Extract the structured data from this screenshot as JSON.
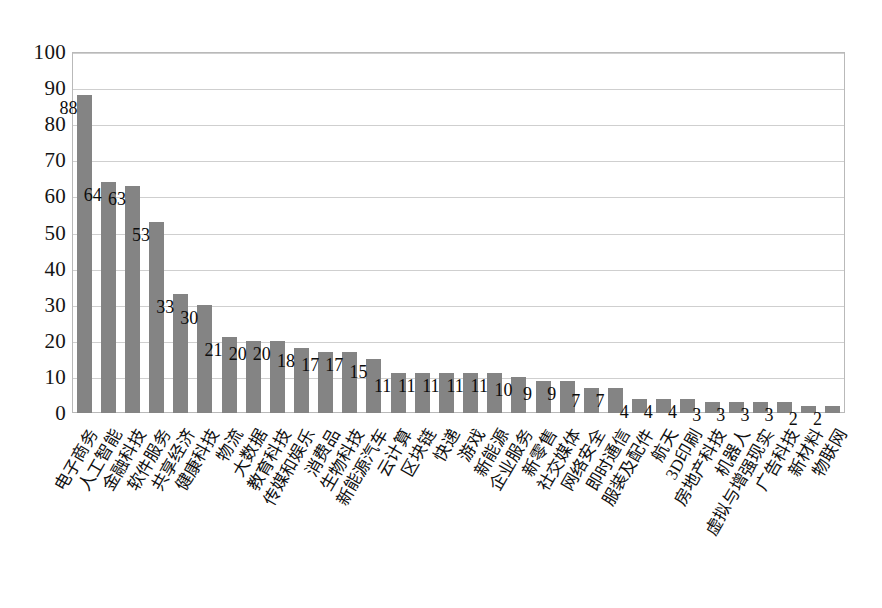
{
  "chart_data": {
    "type": "bar",
    "title": "",
    "subtitle": "",
    "xlabel": "",
    "ylabel": "",
    "ylim": [
      0,
      100
    ],
    "yticks": [
      0,
      10,
      20,
      30,
      40,
      50,
      60,
      70,
      80,
      90,
      100
    ],
    "ytick_labels": [
      "0",
      "10",
      "20",
      "30",
      "40",
      "50",
      "60",
      "70",
      "80",
      "90",
      "100"
    ],
    "grid": "horizontal",
    "legend": "none",
    "bar_color": "#848484",
    "gridline_color": "#cfcfcf",
    "plot_border_color": "#b9b9b9",
    "value_label_color": "#0d0d0d",
    "categories": [
      "电子商务",
      "人工智能",
      "金融科技",
      "软件服务",
      "共享经济",
      "健康科技",
      "物流",
      "大数据",
      "教育科技",
      "传媒和娱乐",
      "消费品",
      "生物科技",
      "新能源汽车",
      "云计算",
      "区块链",
      "快递",
      "游戏",
      "新能源",
      "企业服务",
      "新零售",
      "社交媒体",
      "网络安全",
      "即时通信",
      "服装及配件",
      "航天",
      "3D印刷",
      "房地产科技",
      "机器人",
      "虚拟与增强现实",
      "广告科技",
      "新材料",
      "物联网"
    ],
    "values": [
      88,
      64,
      63,
      53,
      33,
      30,
      21,
      20,
      20,
      18,
      17,
      17,
      15,
      11,
      11,
      11,
      11,
      11,
      10,
      9,
      9,
      7,
      7,
      4,
      4,
      4,
      3,
      3,
      3,
      3,
      2,
      2
    ],
    "value_labels": [
      "88",
      "64",
      "63",
      "53",
      "33",
      "30",
      "21",
      "20",
      "20",
      "18",
      "17",
      "17",
      "15",
      "11",
      "11",
      "11",
      "11",
      "11",
      "10",
      "9",
      "9",
      "7",
      "7",
      "4",
      "4",
      "4",
      "3",
      "3",
      "3",
      "3",
      "2",
      "2"
    ]
  }
}
